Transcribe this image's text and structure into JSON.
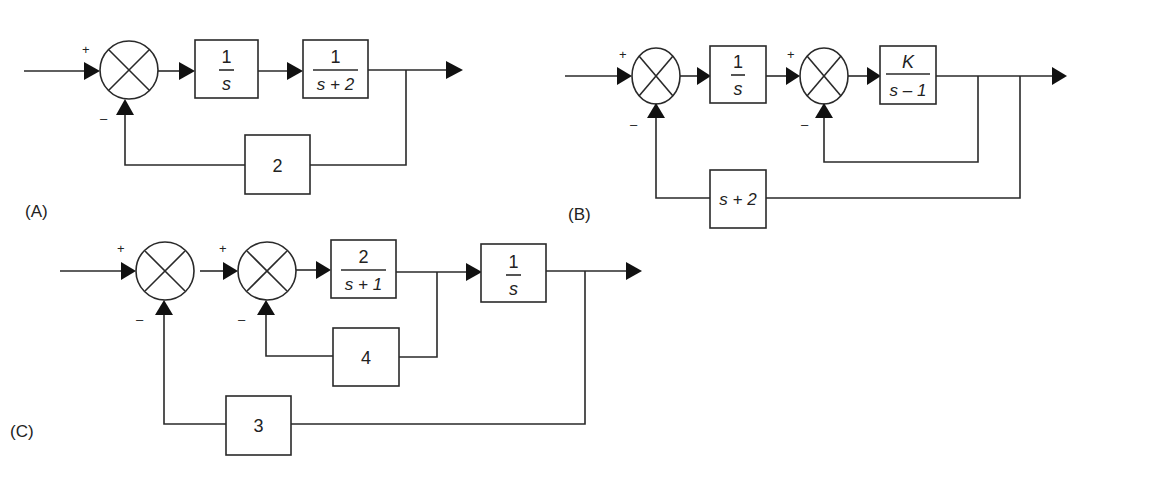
{
  "diagrams": {
    "A": {
      "label": "(A)",
      "summer_signs": {
        "plus": "+",
        "minus": "–"
      },
      "blocks": {
        "b1": {
          "num": "1",
          "den": "s"
        },
        "b2": {
          "num": "1",
          "den": "s + 2"
        },
        "feedback": {
          "value": "2"
        }
      }
    },
    "B": {
      "label": "(B)",
      "summer1_signs": {
        "plus": "+",
        "minus": "–"
      },
      "summer2_signs": {
        "plus": "+",
        "minus": "–"
      },
      "blocks": {
        "b1": {
          "num": "1",
          "den": "s"
        },
        "b2": {
          "num": "K",
          "den": "s – 1"
        },
        "feedback": {
          "value": "s + 2"
        }
      }
    },
    "C": {
      "label": "(C)",
      "summer1_signs": {
        "plus": "+",
        "minus": "–"
      },
      "summer2_signs": {
        "plus": "+",
        "minus": "–"
      },
      "blocks": {
        "b1": {
          "num": "2",
          "den": "s + 1"
        },
        "b2": {
          "num": "1",
          "den": "s"
        },
        "inner_feedback": {
          "value": "4"
        },
        "outer_feedback": {
          "value": "3"
        }
      }
    }
  }
}
